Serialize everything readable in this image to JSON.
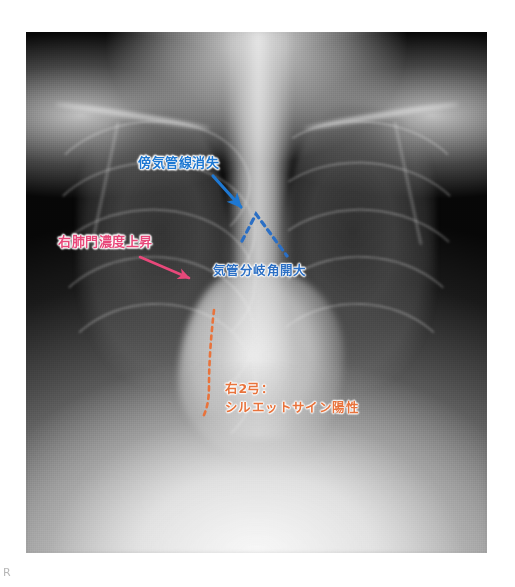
{
  "image": {
    "modality_label": "chest-radiograph",
    "side_marker": "R",
    "frame": {
      "x": 26,
      "y": 32,
      "width": 461,
      "height": 521
    }
  },
  "annotations": {
    "paratracheal": {
      "text": "傍気管線消失",
      "color": "#1E78D2",
      "marker": "arrow",
      "arrow_from": {
        "x": 213,
        "y": 176
      },
      "arrow_to": {
        "x": 241,
        "y": 207
      }
    },
    "hilar": {
      "text": "右肺門濃度上昇",
      "color": "#E8487A",
      "marker": "arrow",
      "arrow_from": {
        "x": 140,
        "y": 257
      },
      "arrow_to": {
        "x": 189,
        "y": 278
      }
    },
    "carina": {
      "text": "気管分岐角開大",
      "color": "#2B6FC4",
      "marker": "dashed-angle",
      "apex": {
        "x": 256,
        "y": 214
      },
      "arm_left": {
        "x": 242,
        "y": 241
      },
      "arm_right": {
        "x": 287,
        "y": 256
      }
    },
    "silhouette": {
      "line1": "右2弓：",
      "line2": "シルエットサイン陽性",
      "color": "#E8733C",
      "marker": "dashed-curve",
      "curve_top": {
        "x": 214,
        "y": 310
      },
      "curve_bottom": {
        "x": 205,
        "y": 416
      }
    }
  }
}
